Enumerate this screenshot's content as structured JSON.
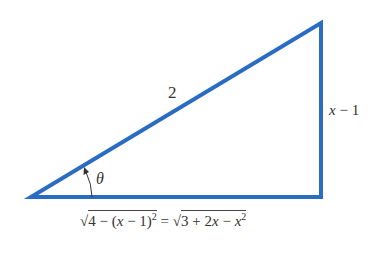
{
  "diagram": {
    "type": "right-triangle",
    "stroke_color": "#2a6bc4",
    "vertices": {
      "angle_vertex": [
        31,
        197
      ],
      "right_angle_vertex": [
        321,
        197
      ],
      "top_vertex": [
        321,
        23
      ]
    },
    "labels": {
      "hypotenuse": "2",
      "vertical_side_var": "x",
      "vertical_side_rest": " − 1",
      "angle": "θ",
      "base_left_radicand_a": "4 − (",
      "base_left_x": "x",
      "base_left_radicand_b": " − 1)",
      "base_left_exp": "2",
      "equals": " = ",
      "base_right_radicand_a": "3 + 2",
      "base_right_x1": "x",
      "base_right_radicand_b": " − ",
      "base_right_x2": "x",
      "base_right_exp": "2",
      "sqrt_symbol": "√"
    }
  }
}
